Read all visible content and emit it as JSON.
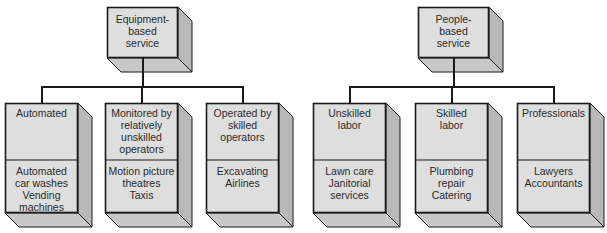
{
  "diagram": {
    "groups": [
      {
        "root": {
          "label": [
            "Equipment-",
            "based",
            "service"
          ]
        },
        "children": [
          {
            "category": [
              "Automated"
            ],
            "examples": [
              "Automated",
              "car washes",
              "Vending",
              "machines"
            ]
          },
          {
            "category": [
              "Monitored by",
              "relatively",
              "unskilled",
              "operators"
            ],
            "examples": [
              "Motion picture",
              "theatres",
              "Taxis"
            ]
          },
          {
            "category": [
              "Operated by",
              "skilled",
              "operators"
            ],
            "examples": [
              "Excavating",
              "Airlines"
            ]
          }
        ]
      },
      {
        "root": {
          "label": [
            "People-",
            "based",
            "service"
          ]
        },
        "children": [
          {
            "category": [
              "Unskilled",
              "labor"
            ],
            "examples": [
              "Lawn care",
              "Janitorial",
              "services"
            ]
          },
          {
            "category": [
              "Skilled",
              "labor"
            ],
            "examples": [
              "Plumbing",
              "repair",
              "Catering"
            ]
          },
          {
            "category": [
              "Professionals"
            ],
            "examples": [
              "Lawyers",
              "Accountants"
            ]
          }
        ]
      }
    ],
    "colors": {
      "front": "#dedede",
      "side": "#b8b8b8",
      "bottom": "#c8c8c8",
      "line": "#1a1a1a"
    }
  }
}
